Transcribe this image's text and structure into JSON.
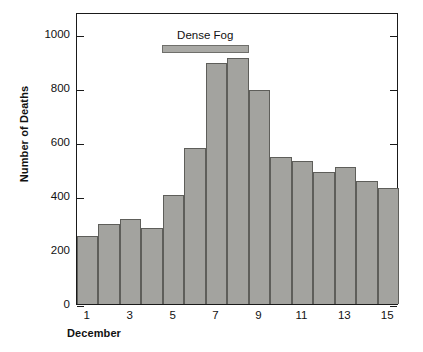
{
  "chart_data": {
    "type": "bar",
    "title": "",
    "xlabel": "December",
    "ylabel": "Number of Deaths",
    "categories": [
      "1",
      "2",
      "3",
      "4",
      "5",
      "6",
      "7",
      "8",
      "9",
      "10",
      "11",
      "12",
      "13",
      "14",
      "15"
    ],
    "values": [
      250,
      297,
      315,
      283,
      405,
      578,
      890,
      910,
      790,
      545,
      530,
      490,
      505,
      455,
      430
    ],
    "ylim": [
      0,
      1080
    ],
    "xlim": [
      0.5,
      15.5
    ],
    "yticks": [
      0,
      200,
      400,
      600,
      800,
      1000
    ],
    "ytick_labels": [
      "0",
      "200",
      "400",
      "600",
      "800",
      "1000"
    ],
    "xticks": [
      1,
      3,
      5,
      7,
      9,
      11,
      13,
      15
    ],
    "xtick_labels": [
      "1",
      "3",
      "5",
      "7",
      "9",
      "11",
      "13",
      "15"
    ],
    "grid": false,
    "legend": "none",
    "annotations": [
      {
        "label": "Dense Fog",
        "x_start": 4.45,
        "x_end": 8.5,
        "y": 965
      }
    ],
    "colors": {
      "bar_fill": "#a3a39f",
      "bar_edge": "#5e5e5a",
      "annotation_fill": "#a9a9a5",
      "annotation_edge": "#6f6f6b",
      "axis": "#1a1a1a",
      "text": "#111111",
      "background": "#ffffff"
    }
  }
}
